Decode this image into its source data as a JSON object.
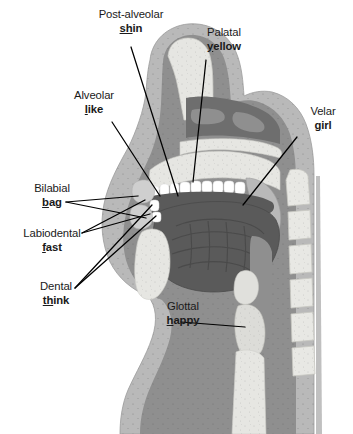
{
  "diagram": {
    "type": "sagittal-cross-section",
    "labels": [
      {
        "id": "post-alveolar",
        "term": "Post-alveolar",
        "word_prefix": "",
        "word_highlight": "sh",
        "word_suffix": "in",
        "word_full": "shin",
        "align": "center"
      },
      {
        "id": "palatal",
        "term": "Palatal",
        "word_prefix": "",
        "word_highlight": "y",
        "word_suffix": "ellow",
        "word_full": "yellow",
        "align": "center"
      },
      {
        "id": "alveolar",
        "term": "Alveolar",
        "word_prefix": "",
        "word_highlight": "l",
        "word_suffix": "ike",
        "word_full": "like",
        "align": "center"
      },
      {
        "id": "velar",
        "term": "Velar",
        "word_prefix": "",
        "word_highlight": "g",
        "word_suffix": "irl",
        "word_full": "girl",
        "align": "center"
      },
      {
        "id": "bilabial",
        "term": "Bilabial",
        "word_prefix": "",
        "word_highlight": "b",
        "word_suffix": "ag",
        "word_full": "bag",
        "align": "center"
      },
      {
        "id": "labiodental",
        "term": "Labiodental",
        "word_prefix": "",
        "word_highlight": "f",
        "word_suffix": "ast",
        "word_full": "fast",
        "align": "center"
      },
      {
        "id": "dental",
        "term": "Dental",
        "word_prefix": "",
        "word_highlight": "th",
        "word_suffix": "ink",
        "word_full": "think",
        "align": "center"
      },
      {
        "id": "glottal",
        "term": "Glottal",
        "word_prefix": "",
        "word_highlight": "h",
        "word_suffix": "appy",
        "word_full": "happy",
        "align": "center"
      }
    ],
    "colors": {
      "background": "#ffffff",
      "leader_line": "#000000",
      "label_text": "#1a1a1a",
      "skin_outer": "#b9b9b9",
      "tissue_mid": "#8f8f8f",
      "tissue_dark": "#6e6e6e",
      "tongue": "#5a5a5a",
      "bone_light": "#e6e6e2",
      "teeth": "#ffffff",
      "cavity_dark": "#707070"
    }
  }
}
